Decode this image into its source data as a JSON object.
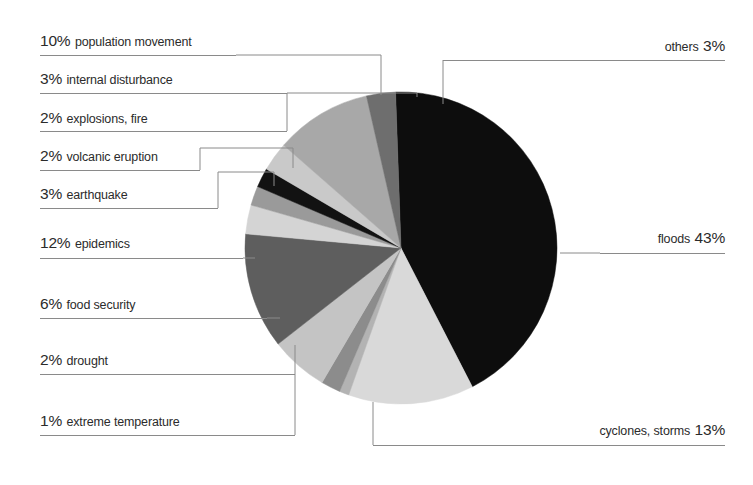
{
  "chart_data": {
    "type": "pie",
    "title": "",
    "subtitle": "",
    "xlabel": "",
    "ylabel": "",
    "legend_position": "callout-labels",
    "grid": false,
    "units": "percent",
    "total": 100,
    "categories": [
      "floods",
      "cyclones, storms",
      "extreme temperature",
      "drought",
      "food security",
      "epidemics",
      "earthquake",
      "volcanic eruption",
      "explosions, fire",
      "internal disturbance",
      "population movement",
      "others"
    ],
    "values": [
      43,
      13,
      1,
      2,
      6,
      12,
      3,
      2,
      2,
      3,
      10,
      3
    ],
    "slice_colors": [
      "#0d0d0d",
      "#d9d9d9",
      "#b3b3b3",
      "#8c8c8c",
      "#c4c4c4",
      "#5e5e5e",
      "#d4d4d4",
      "#9a9a9a",
      "#121212",
      "#c9c9c9",
      "#a8a8a8",
      "#6e6e6e"
    ],
    "slices": [
      {
        "label": "floods",
        "value": 43,
        "display": "floods 43%",
        "color": "#0d0d0d"
      },
      {
        "label": "cyclones, storms",
        "value": 13,
        "display": "cyclones, storms 13%",
        "color": "#d9d9d9"
      },
      {
        "label": "extreme temperature",
        "value": 1,
        "display": "1% extreme temperature",
        "color": "#b3b3b3"
      },
      {
        "label": "drought",
        "value": 2,
        "display": "2% drought",
        "color": "#8c8c8c"
      },
      {
        "label": "food security",
        "value": 6,
        "display": "6% food security",
        "color": "#c4c4c4"
      },
      {
        "label": "epidemics",
        "value": 12,
        "display": "12% epidemics",
        "color": "#5e5e5e"
      },
      {
        "label": "earthquake",
        "value": 3,
        "display": "3% earthquake",
        "color": "#d4d4d4"
      },
      {
        "label": "volcanic eruption",
        "value": 2,
        "display": "2% volcanic eruption",
        "color": "#9a9a9a"
      },
      {
        "label": "explosions, fire",
        "value": 2,
        "display": "2% explosions, fire",
        "color": "#121212"
      },
      {
        "label": "internal disturbance",
        "value": 3,
        "display": "3% internal disturbance",
        "color": "#c9c9c9"
      },
      {
        "label": "population movement",
        "value": 10,
        "display": "10% population movement",
        "color": "#a8a8a8"
      },
      {
        "label": "others",
        "value": 3,
        "display": "others 3%",
        "color": "#6e6e6e"
      }
    ]
  },
  "labels": {
    "left": [
      {
        "pct": "10%",
        "text": "population movement"
      },
      {
        "pct": "3%",
        "text": "internal disturbance"
      },
      {
        "pct": "2%",
        "text": "explosions, fire"
      },
      {
        "pct": "2%",
        "text": "volcanic eruption"
      },
      {
        "pct": "3%",
        "text": "earthquake"
      },
      {
        "pct": "12%",
        "text": "epidemics"
      },
      {
        "pct": "6%",
        "text": "food security"
      },
      {
        "pct": "2%",
        "text": "drought"
      },
      {
        "pct": "1%",
        "text": "extreme temperature"
      }
    ],
    "right": [
      {
        "text": "others",
        "pct": "3%"
      },
      {
        "text": "floods",
        "pct": "43%"
      },
      {
        "text": "cyclones, storms",
        "pct": "13%"
      }
    ]
  }
}
